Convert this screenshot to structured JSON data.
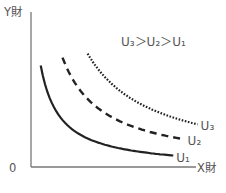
{
  "chart_data": {
    "type": "line",
    "title": "",
    "xlabel": "X財",
    "ylabel": "Y財",
    "origin_label": "0",
    "annotation": "U₃＞U₂＞U₁",
    "xlim": [
      0,
      10
    ],
    "ylim": [
      0,
      10
    ],
    "grid": false,
    "series": [
      {
        "name": "U₁",
        "style": "solid",
        "k": 8,
        "x_range": [
          0.6,
          8.8
        ]
      },
      {
        "name": "U₂",
        "style": "dashed",
        "k": 18,
        "x_range": [
          1.95,
          9.5
        ]
      },
      {
        "name": "U₃",
        "style": "dotted",
        "k": 30,
        "x_range": [
          3.5,
          10.3
        ]
      }
    ]
  },
  "colors": {
    "curve": "#222222",
    "axis": "#777777",
    "text": "#555555"
  }
}
